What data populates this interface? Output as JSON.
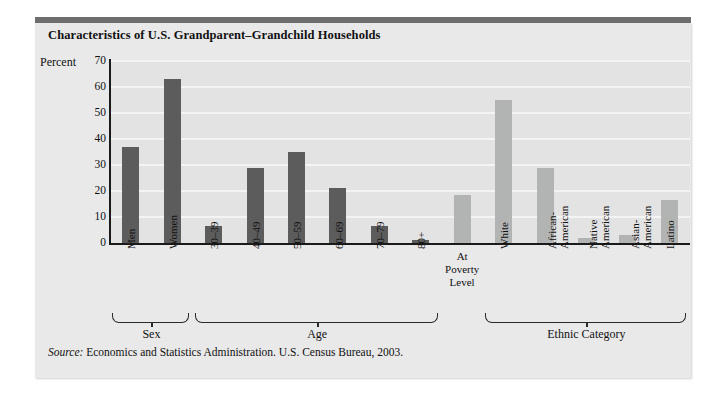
{
  "figure": {
    "title": "Characteristics of U.S. Grandparent–Grandchild Households",
    "y_axis_title": "Percent",
    "source_prefix": "Source:",
    "source_text": " Economics and Statistics Administration. U.S. Census Bureau, 2003.",
    "colors": {
      "bar_dark": "#5c5c5c",
      "bar_light": "#b2b4b4",
      "plot_background": "#e3e3e3",
      "card_background": "#e9e9e9",
      "gridline": "#f4f4f4",
      "axis": "#1a1a1a",
      "top_band": "#6e6e6e"
    }
  },
  "chart_data": {
    "type": "bar",
    "title": "Characteristics of U.S. Grandparent–Grandchild Households",
    "xlabel": "",
    "ylabel": "Percent",
    "ylim": [
      0,
      70
    ],
    "yticks": [
      0,
      10,
      20,
      30,
      40,
      50,
      60,
      70
    ],
    "grid": true,
    "legend": "none",
    "categories": [
      "Men",
      "Women",
      "30–39",
      "40–49",
      "50–59",
      "60–69",
      "70–79",
      "80+",
      "At Poverty Level",
      "White",
      "African-American",
      "Native American",
      "Asian-American",
      "Latino"
    ],
    "values": [
      37,
      63,
      6.5,
      29,
      35,
      21,
      6.5,
      1,
      18.5,
      55,
      29,
      2,
      3,
      16.5
    ],
    "bar_shades": [
      "dark",
      "dark",
      "dark",
      "dark",
      "dark",
      "dark",
      "dark",
      "dark",
      "light",
      "light",
      "light",
      "light",
      "light",
      "light"
    ],
    "groups": [
      {
        "label": "Sex",
        "first": 0,
        "last": 1
      },
      {
        "label": "Age",
        "first": 2,
        "last": 7
      },
      {
        "label": "Ethnic Category",
        "first": 9,
        "last": 13
      }
    ],
    "tick_labels": [
      {
        "text": "Men",
        "orientation": "vertical",
        "lines": [
          "Men"
        ]
      },
      {
        "text": "Women",
        "orientation": "vertical",
        "lines": [
          "Women"
        ]
      },
      {
        "text": "30–39",
        "orientation": "vertical",
        "lines": [
          "30–39"
        ]
      },
      {
        "text": "40–49",
        "orientation": "vertical",
        "lines": [
          "40–49"
        ]
      },
      {
        "text": "50–59",
        "orientation": "vertical",
        "lines": [
          "50–59"
        ]
      },
      {
        "text": "60–69",
        "orientation": "vertical",
        "lines": [
          "60–69"
        ]
      },
      {
        "text": "70–79",
        "orientation": "vertical",
        "lines": [
          "70–79"
        ]
      },
      {
        "text": "80+",
        "orientation": "vertical",
        "lines": [
          "80+"
        ]
      },
      {
        "text": "At Poverty Level",
        "orientation": "horizontal",
        "lines": [
          "At",
          "Poverty",
          "Level"
        ]
      },
      {
        "text": "White",
        "orientation": "vertical",
        "lines": [
          "White"
        ]
      },
      {
        "text": "African-American",
        "orientation": "vertical",
        "lines": [
          "African-",
          "American"
        ]
      },
      {
        "text": "Native American",
        "orientation": "vertical",
        "lines": [
          "Native",
          "American"
        ]
      },
      {
        "text": "Asian-American",
        "orientation": "vertical",
        "lines": [
          "Asian-",
          "American"
        ]
      },
      {
        "text": "Latino",
        "orientation": "vertical",
        "lines": [
          "Latino"
        ]
      }
    ]
  }
}
